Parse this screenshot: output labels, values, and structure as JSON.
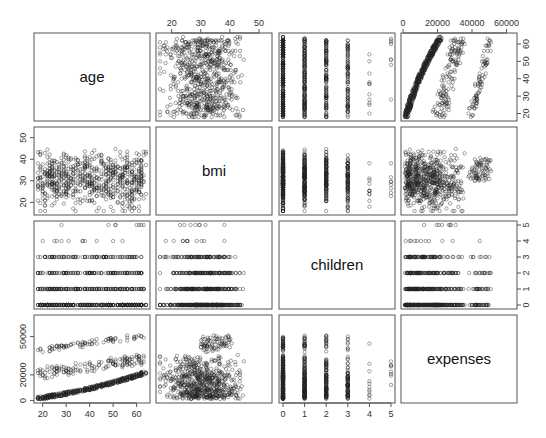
{
  "chart_data": {
    "type": "scatter",
    "kind": "pairs-scatterplot-matrix",
    "title": "",
    "variables": [
      "age",
      "bmi",
      "children",
      "expenses"
    ],
    "ranges": {
      "age": [
        18,
        64
      ],
      "bmi": [
        16,
        53.1
      ],
      "children": [
        0,
        5
      ],
      "expenses": [
        1122,
        63770
      ]
    },
    "ticks": {
      "age": {
        "values": [
          20,
          30,
          40,
          50,
          60
        ],
        "labels": [
          "20",
          "30",
          "40",
          "50",
          "60"
        ],
        "side": "bottom"
      },
      "bmi": {
        "values": [
          20,
          30,
          40,
          50
        ],
        "labels": [
          "20",
          "30",
          "40",
          "50"
        ],
        "side": "top-and-left"
      },
      "children": {
        "values": [
          0,
          1,
          2,
          3,
          4,
          5
        ],
        "labels": [
          "0",
          "1",
          "2",
          "3",
          "4",
          "5"
        ],
        "side": "bottom-and-right"
      },
      "expenses": {
        "values": [
          0,
          20000,
          40000,
          60000
        ],
        "labels": [
          "0",
          "20000",
          "40000",
          "60000"
        ],
        "side": "top-and-left"
      }
    },
    "age_ticks_right": {
      "values": [
        20,
        30,
        40,
        50,
        60
      ],
      "labels": [
        "20",
        "30",
        "40",
        "50",
        "60"
      ]
    },
    "expenses_ticks_left": {
      "values": [
        0,
        20000,
        50000
      ],
      "labels": [
        "0",
        "20000",
        "50000"
      ]
    },
    "n_points": 1338,
    "point_marker": "open-circle",
    "point_color": "#222222",
    "description": {
      "age_vs_expenses": "three bands: dense lower band rising from ~1000 to ~14000 with age; middle band ~15000-30000; upper band ~35000-50000",
      "bmi_vs_expenses": "dense cluster below 15000 across bmi; branch rising above 30000 for bmi > 30",
      "children_vs_others": "discrete columns at 0-5, fewer points at 4 and 5",
      "age_vs_bmi": "no clear relationship, bmi centered ~30"
    },
    "xlabel": "",
    "ylabel": ""
  }
}
